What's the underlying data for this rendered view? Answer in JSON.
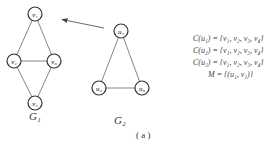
{
  "graphs": {
    "g1": {
      "label": "G₁",
      "nodes": [
        {
          "id": "v1",
          "label": "v₁",
          "x": 35,
          "y": 14
        },
        {
          "id": "v2",
          "label": "v₂",
          "x": 14,
          "y": 61
        },
        {
          "id": "v3",
          "label": "v₃",
          "x": 54,
          "y": 61
        },
        {
          "id": "v4",
          "label": "v₄",
          "x": 35,
          "y": 103
        }
      ],
      "edges": [
        [
          "v1",
          "v2"
        ],
        [
          "v1",
          "v3"
        ],
        [
          "v2",
          "v3"
        ],
        [
          "v2",
          "v4"
        ],
        [
          "v3",
          "v4"
        ]
      ]
    },
    "g2": {
      "label": "G₂",
      "nodes": [
        {
          "id": "u1",
          "label": "u₁",
          "x": 121,
          "y": 31
        },
        {
          "id": "u2",
          "label": "u₂",
          "x": 99,
          "y": 88
        },
        {
          "id": "u3",
          "label": "u₃",
          "x": 142,
          "y": 88
        }
      ],
      "edges": [
        [
          "u1",
          "u2"
        ],
        [
          "u1",
          "u3"
        ],
        [
          "u2",
          "u3"
        ]
      ]
    }
  },
  "arrow": {
    "from": [
      104,
      28
    ],
    "to": [
      60,
      19
    ]
  },
  "equations": [
    "C(u₁) = {v₁, v₂, v₃, v₄}",
    "C(u₂) = {v₁, v₂, v₃, v₄}",
    "C(u₃) = {v₁, v₂, v₃, v₄}",
    "M = {(u₁, v₁)}"
  ],
  "caption": "( a )"
}
